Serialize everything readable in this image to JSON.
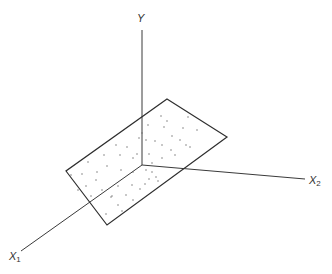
{
  "diagram": {
    "colors": {
      "line": "#2e2e2e",
      "dot": "#666666",
      "background": "#ffffff"
    },
    "origin": [
      142,
      165
    ],
    "axes": {
      "y": {
        "label": "Y",
        "end": [
          142,
          30
        ],
        "label_pos": [
          137,
          13
        ]
      },
      "x1": {
        "label": "X",
        "subscript": "1",
        "end": [
          21,
          251
        ],
        "label_pos": [
          9,
          251
        ]
      },
      "x2": {
        "label": "X",
        "subscript": "2",
        "end": [
          305,
          179
        ],
        "label_pos": [
          309,
          175
        ]
      }
    },
    "plane": {
      "corners": [
        [
          167,
          99
        ],
        [
          227,
          137
        ],
        [
          107,
          225
        ],
        [
          66,
          171
        ]
      ]
    },
    "points": [
      [
        161,
        116
      ],
      [
        167,
        121
      ],
      [
        188,
        117
      ],
      [
        148,
        125
      ],
      [
        183,
        128
      ],
      [
        197,
        130
      ],
      [
        172,
        136
      ],
      [
        146,
        140
      ],
      [
        155,
        141
      ],
      [
        162,
        145
      ],
      [
        180,
        140
      ],
      [
        186,
        145
      ],
      [
        139,
        138
      ],
      [
        127,
        147
      ],
      [
        116,
        145
      ],
      [
        104,
        155
      ],
      [
        120,
        155
      ],
      [
        133,
        158
      ],
      [
        149,
        154
      ],
      [
        162,
        158
      ],
      [
        175,
        155
      ],
      [
        190,
        147
      ],
      [
        88,
        162
      ],
      [
        97,
        172
      ],
      [
        107,
        166
      ],
      [
        121,
        170
      ],
      [
        133,
        172
      ],
      [
        71,
        175
      ],
      [
        82,
        174
      ],
      [
        96,
        180
      ],
      [
        86,
        186
      ],
      [
        102,
        190
      ],
      [
        118,
        186
      ],
      [
        132,
        185
      ],
      [
        146,
        170
      ],
      [
        152,
        172
      ],
      [
        156,
        177
      ],
      [
        149,
        179
      ],
      [
        158,
        181
      ],
      [
        145,
        184
      ],
      [
        126,
        195
      ],
      [
        112,
        196
      ],
      [
        118,
        205
      ],
      [
        133,
        200
      ],
      [
        140,
        189
      ],
      [
        122,
        211
      ],
      [
        106,
        214
      ],
      [
        111,
        197
      ],
      [
        78,
        190
      ],
      [
        91,
        196
      ],
      [
        152,
        163
      ],
      [
        137,
        154
      ],
      [
        142,
        133
      ],
      [
        171,
        150
      ],
      [
        164,
        127
      ]
    ]
  }
}
